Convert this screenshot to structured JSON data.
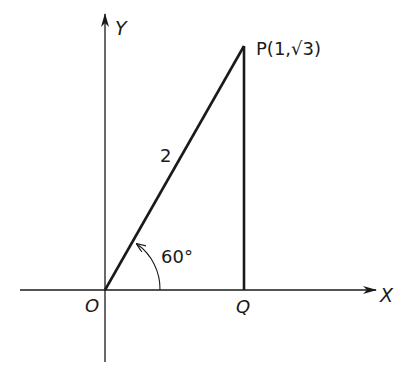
{
  "diagram": {
    "type": "geometry",
    "axes": {
      "x_label": "X",
      "y_label": "Y"
    },
    "points": {
      "origin": {
        "label": "O"
      },
      "p": {
        "label": "P(1,√3)"
      },
      "q": {
        "label": "Q"
      }
    },
    "segments": {
      "op_length_label": "2"
    },
    "angle": {
      "label": "60°"
    },
    "colors": {
      "stroke": "#1a1a1a",
      "background": "#ffffff"
    }
  }
}
